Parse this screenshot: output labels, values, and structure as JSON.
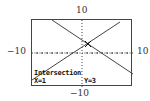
{
  "window": {
    "xmin": -10,
    "xmax": 10,
    "ymin": -10,
    "ymax": 10,
    "labels": {
      "top": "10",
      "bottom": "−10",
      "left": "−10",
      "right": "10"
    }
  },
  "graphs": [
    {
      "name": "rising-line",
      "equation": "y = x + 2"
    },
    {
      "name": "falling-line",
      "equation": "y = -x + 4"
    }
  ],
  "status": {
    "mode": "Intersection",
    "x_readout": "X=1",
    "y_readout": "Y=3"
  },
  "colors": {
    "line": "#444444",
    "frame": "#444444",
    "text": "#111111"
  }
}
